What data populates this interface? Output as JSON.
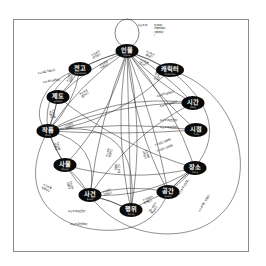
{
  "diagram": {
    "title": "",
    "nodes": [
      {
        "id": "figure",
        "ko": "인물",
        "en": "Figure"
      },
      {
        "id": "precedent",
        "ko": "전고",
        "en": "Precedent"
      },
      {
        "id": "character",
        "ko": "캐릭터",
        "en": "Character"
      },
      {
        "id": "system",
        "ko": "제도",
        "en": "System"
      },
      {
        "id": "date",
        "ko": "시간",
        "en": "Date"
      },
      {
        "id": "work",
        "ko": "작품",
        "en": "Work"
      },
      {
        "id": "time",
        "ko": "시점",
        "en": "Time"
      },
      {
        "id": "object",
        "ko": "사물",
        "en": "Object"
      },
      {
        "id": "place",
        "ko": "장소",
        "en": "Place"
      },
      {
        "id": "event",
        "ko": "사건",
        "en": "Event"
      },
      {
        "id": "space",
        "ko": "공간",
        "en": "Space"
      },
      {
        "id": "doing",
        "ko": "행위",
        "en": "Doing"
      }
    ],
    "self_loop_note": [
      "A는 B와 친구이다",
      "/아버지이다",
      "/제자이다",
      "/"
    ],
    "edge_labels": [
      {
        "id": "precedent-figure",
        "lines": [
          "A는 B와",
          "관련된다"
        ]
      },
      {
        "id": "figure-precedent",
        "lines": [
          "A는 B를",
          "인용하다"
        ]
      },
      {
        "id": "work-precedent",
        "lines": [
          "A는 B를 인용하다"
        ]
      },
      {
        "id": "precedent-work",
        "lines": [
          "A는 B와 관련된다"
        ]
      },
      {
        "id": "system-precedent",
        "lines": [
          "A는 B와",
          "관련된다"
        ]
      },
      {
        "id": "system-figure",
        "lines": [
          "A는 B를",
          "정립하다"
        ]
      },
      {
        "id": "figure-character",
        "lines": [
          "A는 B와",
          "관련된다"
        ]
      },
      {
        "id": "character-figure",
        "lines": [
          "A는 B를",
          "만들었다"
        ]
      },
      {
        "id": "work-character",
        "lines": [
          "A는 B를",
          "등장시키다"
        ]
      },
      {
        "id": "figure-date",
        "lines": [
          "A는 B에 발생한다"
        ]
      },
      {
        "id": "event-date",
        "lines": [
          "A는 B에 발생한다"
        ]
      },
      {
        "id": "figure-time",
        "lines": [
          "A는 B와 관련된다"
        ]
      },
      {
        "id": "work-time",
        "lines": [
          "A는 B와관련된다"
        ]
      },
      {
        "id": "work-system",
        "lines": [
          "A는 B를",
          "반영하다"
        ]
      },
      {
        "id": "work-object",
        "lines": [
          "A는 B를",
          "묘사하다"
        ]
      },
      {
        "id": "work-figure",
        "lines": [
          "A는 B를",
          "제작하다"
        ]
      },
      {
        "id": "object-event",
        "lines": [
          "A는 B를",
          "인용하다"
        ]
      },
      {
        "id": "object-work",
        "lines": [
          "A는 B와",
          "관련된다"
        ]
      },
      {
        "id": "figure-place",
        "lines": [
          "A는 B를 인용하다"
        ]
      },
      {
        "id": "event-place",
        "lines": [
          "A는 B와 관련된다"
        ]
      },
      {
        "id": "figure-space",
        "lines": [
          "A는 B를",
          "거주하다"
        ]
      },
      {
        "id": "event-figure",
        "lines": [
          "A는 B와",
          "관련된다"
        ]
      },
      {
        "id": "doing-figure",
        "lines": [
          "A는 B를",
          "행하다"
        ]
      },
      {
        "id": "event-doing",
        "lines": [
          "A는 B와",
          "관련된다"
        ]
      },
      {
        "id": "doing-space",
        "lines": [
          "A는 B에서",
          "발생하다"
        ]
      },
      {
        "id": "event-space",
        "lines": [
          "A는 B에서",
          "발생하다"
        ]
      },
      {
        "id": "place-space",
        "lines": [
          "A는 B에 포함된다"
        ]
      },
      {
        "id": "work-event",
        "lines": [
          "A는 B와 관련된다"
        ]
      },
      {
        "id": "work-event-2",
        "lines": [
          "A는 B를 인용하다"
        ]
      },
      {
        "id": "space-work",
        "lines": [
          "A는 B에서 포함된다"
        ]
      }
    ]
  }
}
